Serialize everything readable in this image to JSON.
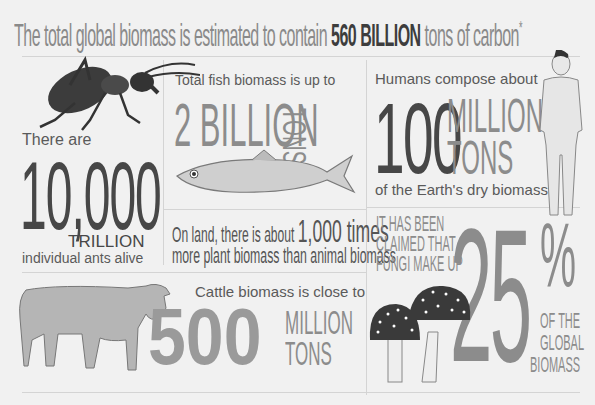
{
  "header": {
    "title_pre": "The total global biomass is estimated to contain",
    "title_bold": "560 BILLION",
    "title_post": "tons of carbon",
    "title_mark": "*"
  },
  "ants": {
    "intro": "There are",
    "number": "10,000",
    "unit": "TRILLION",
    "caption": "individual ants alive"
  },
  "fish": {
    "intro": "Total fish biomass is up to",
    "number": "2 BILLION",
    "unit": "TONS"
  },
  "humans": {
    "intro": "Humans compose about",
    "number": "100",
    "unit_line1": "MILLION",
    "unit_line2": "TONS",
    "caption": "of the Earth's dry biomass"
  },
  "plants": {
    "line1_pre": "On land, there is about",
    "line1_bold": "1,000 times",
    "line2": "more plant biomass than animal biomass"
  },
  "cattle": {
    "intro": "Cattle biomass is close to",
    "number": "500",
    "unit_line1": "MILLION",
    "unit_line2": "TONS"
  },
  "fungi": {
    "claim_line1": "IT HAS BEEN",
    "claim_line2": "CLAIMED THAT",
    "claim_line3": "FUNGI MAKE UP",
    "number": "25",
    "percent": "%",
    "caption_line1": "OF THE",
    "caption_line2": "GLOBAL",
    "caption_line3": "BIOMASS"
  },
  "colors": {
    "background": "#f1f1f1",
    "text_dark": "#474747",
    "text_gray": "#8c8c8c",
    "grid_line": "#d4d4d4"
  }
}
